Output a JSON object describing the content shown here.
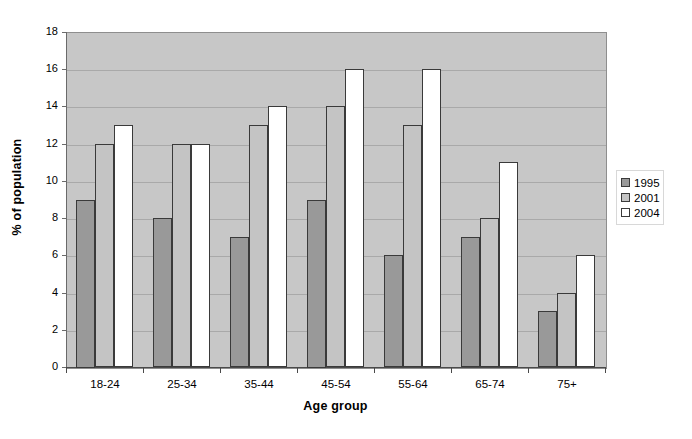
{
  "chart_data": {
    "type": "bar",
    "title": "",
    "xlabel": "Age group",
    "ylabel": "% of population",
    "categories": [
      "18-24",
      "25-34",
      "35-44",
      "45-54",
      "55-64",
      "65-74",
      "75+"
    ],
    "series": [
      {
        "name": "1995",
        "color": "#999999",
        "values": [
          9,
          8,
          7,
          9,
          6,
          7,
          3
        ]
      },
      {
        "name": "2001",
        "color": "#c4c4c4",
        "values": [
          12,
          12,
          13,
          14,
          13,
          8,
          4
        ]
      },
      {
        "name": "2004",
        "color": "#ffffff",
        "values": [
          13,
          12,
          14,
          16,
          16,
          11,
          6
        ]
      }
    ],
    "ylim": [
      0,
      18
    ],
    "ytick_values": [
      0,
      2,
      4,
      6,
      8,
      10,
      12,
      14,
      16,
      18
    ],
    "ytick_labels": [
      "0",
      "2",
      "4",
      "6",
      "8",
      "10",
      "12",
      "14",
      "16",
      "18"
    ],
    "grid": true,
    "grid_axis": "y",
    "legend_position": "right",
    "plot_background": "#c7c7c7",
    "figure_background": "#ffffff"
  }
}
